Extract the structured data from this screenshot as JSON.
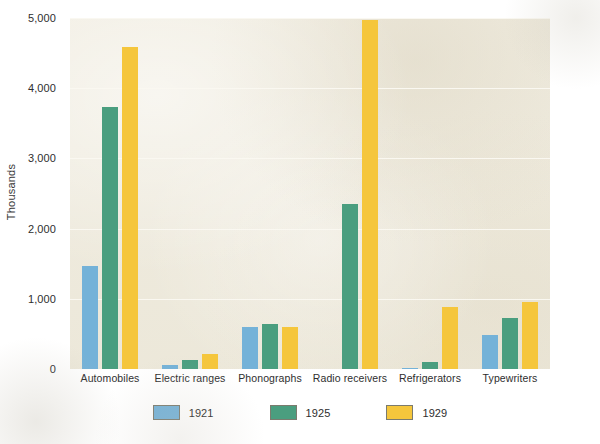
{
  "chart_data": {
    "type": "bar",
    "title": "",
    "xlabel": "",
    "ylabel": "Thousands",
    "categories": [
      "Automobiles",
      "Electric ranges",
      "Phonographs",
      "Radio receivers",
      "Refrigerators",
      "Typewriters"
    ],
    "series": [
      {
        "name": "1921",
        "color": "#74b2d8",
        "values": [
          1468,
          57,
          596,
          0,
          5,
          481
        ]
      },
      {
        "name": "1925",
        "color": "#4a9e7f",
        "values": [
          3735,
          130,
          643,
          2349,
          97,
          727
        ]
      },
      {
        "name": "1929",
        "color": "#f5c63c",
        "values": [
          4587,
          219,
          594,
          4978,
          880,
          953
        ]
      }
    ],
    "ylim": [
      0,
      5000
    ],
    "yticks": [
      0,
      1000,
      2000,
      3000,
      4000,
      5000
    ],
    "ytick_labels": [
      "0",
      "1,000",
      "2,000",
      "3,000",
      "4,000",
      "5,000"
    ],
    "grid": true,
    "grid_axis": "y",
    "legend_position": "bottom",
    "plot_background": "#eeeadd",
    "gridline_color": "#faf8f1"
  }
}
